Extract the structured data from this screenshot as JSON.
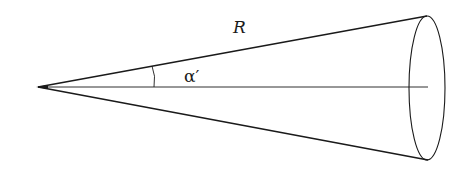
{
  "diagram": {
    "type": "cone",
    "labels": {
      "slant_length": "R",
      "half_angle": "α′"
    },
    "colors": {
      "stroke": "#1a1a1a",
      "background": "#ffffff"
    }
  }
}
